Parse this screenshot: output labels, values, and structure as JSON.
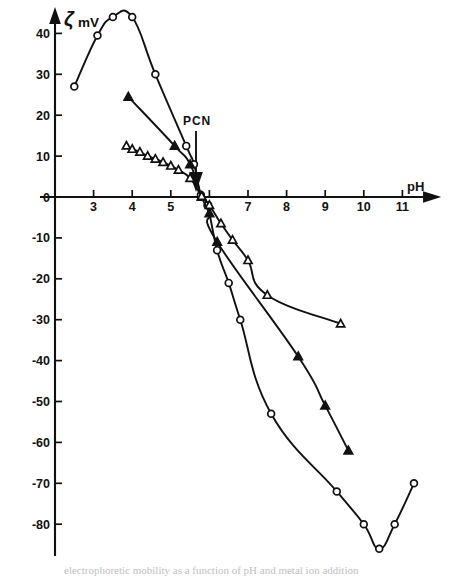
{
  "figure": {
    "title": "",
    "y_axis_label_symbol": "ζ",
    "y_axis_label_unit": "mV",
    "x_axis_label": "pH",
    "annotation_label": "PCN",
    "caption_fragment": "electrophoretic mobility as a function of pH and metal ion addition"
  },
  "chart_data": {
    "type": "line",
    "title": "",
    "xlabel": "pH",
    "ylabel": "ζ mV",
    "xlim": [
      2.2,
      11.9
    ],
    "ylim": [
      -90,
      46
    ],
    "xticks": [
      3,
      4,
      5,
      6,
      7,
      8,
      9,
      10,
      11
    ],
    "yticks": [
      40,
      30,
      20,
      10,
      0,
      -10,
      -20,
      -30,
      -40,
      -50,
      -60,
      -70,
      -80
    ],
    "grid": false,
    "legend_position": "none",
    "annotations": [
      {
        "text": "PCN",
        "x": 5.8,
        "y": 0,
        "label_y": 22,
        "marker": "down-arrow",
        "meaning": "point-of-zero-charge"
      }
    ],
    "series": [
      {
        "name": "open-circles",
        "marker": "open-circle",
        "points": [
          {
            "x": 2.5,
            "y": 27.0
          },
          {
            "x": 3.1,
            "y": 39.5
          },
          {
            "x": 3.5,
            "y": 44.0
          },
          {
            "x": 4.0,
            "y": 44.0
          },
          {
            "x": 4.6,
            "y": 30.0
          },
          {
            "x": 5.4,
            "y": 12.5
          },
          {
            "x": 5.6,
            "y": 8.0
          },
          {
            "x": 5.78,
            "y": 0.5
          },
          {
            "x": 5.95,
            "y": -2.0
          },
          {
            "x": 6.2,
            "y": -13.0
          },
          {
            "x": 6.5,
            "y": -21.0
          },
          {
            "x": 6.8,
            "y": -30.0
          },
          {
            "x": 7.6,
            "y": -53.0
          },
          {
            "x": 9.3,
            "y": -72.0
          },
          {
            "x": 10.0,
            "y": -80.0
          },
          {
            "x": 10.4,
            "y": -86.0
          },
          {
            "x": 10.8,
            "y": -80.0
          },
          {
            "x": 11.3,
            "y": -70.0
          }
        ]
      },
      {
        "name": "filled-triangles",
        "marker": "filled-triangle",
        "points": [
          {
            "x": 3.9,
            "y": 24.5
          },
          {
            "x": 5.1,
            "y": 12.5
          },
          {
            "x": 5.5,
            "y": 8.0
          },
          {
            "x": 5.8,
            "y": 0.0
          },
          {
            "x": 6.0,
            "y": -4.0
          },
          {
            "x": 6.2,
            "y": -11.0
          },
          {
            "x": 8.3,
            "y": -39.0
          },
          {
            "x": 9.0,
            "y": -51.0
          },
          {
            "x": 9.6,
            "y": -62.0
          }
        ]
      },
      {
        "name": "open-triangles",
        "marker": "open-triangle",
        "points": [
          {
            "x": 3.85,
            "y": 12.5
          },
          {
            "x": 4.0,
            "y": 11.7
          },
          {
            "x": 4.2,
            "y": 11.0
          },
          {
            "x": 4.4,
            "y": 10.0
          },
          {
            "x": 4.6,
            "y": 9.3
          },
          {
            "x": 4.8,
            "y": 8.5
          },
          {
            "x": 5.0,
            "y": 7.6
          },
          {
            "x": 5.2,
            "y": 6.6
          },
          {
            "x": 5.5,
            "y": 4.6
          },
          {
            "x": 5.8,
            "y": 0.2
          },
          {
            "x": 6.0,
            "y": -2.0
          },
          {
            "x": 6.3,
            "y": -6.5
          },
          {
            "x": 6.6,
            "y": -10.5
          },
          {
            "x": 7.0,
            "y": -15.5
          },
          {
            "x": 7.5,
            "y": -24.0
          },
          {
            "x": 9.4,
            "y": -31.0
          }
        ]
      }
    ]
  }
}
